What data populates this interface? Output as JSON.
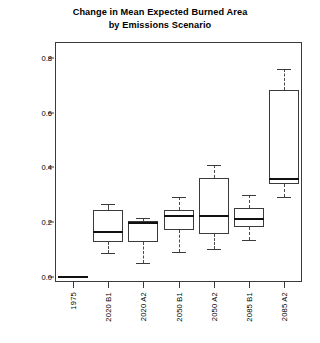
{
  "chart_data": {
    "type": "box",
    "title": "Change in Mean Expected Burned Area by Emissions Scenario",
    "title_lines": [
      "Change in Mean Expected Burned Area",
      "by Emissions Scenario"
    ],
    "xlabel": "",
    "ylabel": "",
    "ylim": [
      -0.02,
      0.86
    ],
    "yticks": [
      0.0,
      0.2,
      0.4,
      0.6,
      0.8
    ],
    "ytick_labels": [
      "0.0",
      "0.2",
      "0.4",
      "0.6",
      "0.8"
    ],
    "grid": false,
    "legend": "none",
    "categories": [
      "1975",
      "2020 B1",
      "2020 A2",
      "2050 B1",
      "2050 A2",
      "2085 B1",
      "2085 A2"
    ],
    "boxes": [
      {
        "category": "1975",
        "whisker_low": 0.0,
        "q1": 0.0,
        "median": 0.0,
        "q3": 0.0,
        "whisker_high": 0.0,
        "degenerate": true
      },
      {
        "category": "2020 B1",
        "whisker_low": 0.085,
        "q1": 0.125,
        "median": 0.165,
        "q3": 0.245,
        "whisker_high": 0.265,
        "degenerate": false
      },
      {
        "category": "2020 A2",
        "whisker_low": 0.05,
        "q1": 0.125,
        "median": 0.197,
        "q3": 0.205,
        "whisker_high": 0.213,
        "degenerate": false
      },
      {
        "category": "2050 B1",
        "whisker_low": 0.09,
        "q1": 0.17,
        "median": 0.222,
        "q3": 0.245,
        "whisker_high": 0.29,
        "degenerate": false
      },
      {
        "category": "2050 A2",
        "whisker_low": 0.1,
        "q1": 0.155,
        "median": 0.222,
        "q3": 0.363,
        "whisker_high": 0.41,
        "degenerate": false
      },
      {
        "category": "2085 B1",
        "whisker_low": 0.135,
        "q1": 0.182,
        "median": 0.212,
        "q3": 0.253,
        "whisker_high": 0.298,
        "degenerate": false
      },
      {
        "category": "2085 A2",
        "whisker_low": 0.29,
        "q1": 0.34,
        "median": 0.358,
        "q3": 0.685,
        "whisker_high": 0.76,
        "degenerate": false
      }
    ]
  },
  "colors": {
    "background": "#ffffff",
    "axis": "#3a3a3a",
    "line": "#111111"
  }
}
